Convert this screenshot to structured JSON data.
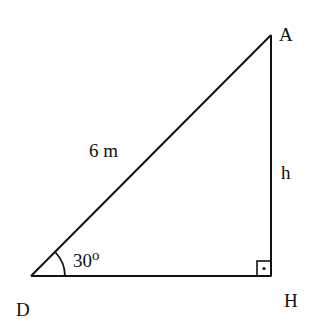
{
  "diagram": {
    "type": "right-triangle",
    "vertices": {
      "A": "A",
      "D": "D",
      "H": "H"
    },
    "labels": {
      "hypotenuse": "6 m",
      "height": "h",
      "angle": "30",
      "angle_unit": "o"
    },
    "right_angle_at": "H",
    "angle_at": "D",
    "colors": {
      "stroke": "#111111",
      "background": "#ffffff"
    }
  }
}
